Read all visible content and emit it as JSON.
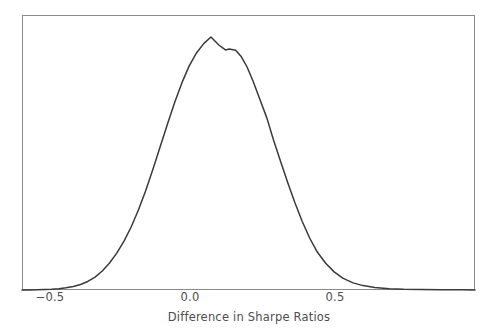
{
  "figure": {
    "background_color": "#ffffff",
    "axes_background_color": "#ffffff"
  },
  "axes": {
    "spine_color": "#8a8a8a",
    "spine_width": 1,
    "left_px": 22,
    "right_px": 475,
    "top_px": 15,
    "bottom_px": 290
  },
  "chart_data": {
    "type": "line",
    "title": "",
    "subtitle": "",
    "xlabel": "Difference in Sharpe Ratios",
    "ylabel": "",
    "grid": false,
    "legend": null,
    "legend_position": "none",
    "line_color": "#3a3a3a",
    "line_width": 1.5,
    "xticks": [
      -0.5,
      0.0,
      0.5
    ],
    "xtick_labels": [
      "−0.5",
      "0.0",
      "0.5"
    ],
    "yticks": [],
    "ytick_labels": [],
    "xlim": [
      -0.597,
      0.966
    ],
    "ylim": [
      0,
      1.0
    ],
    "series": [
      {
        "name": "Difference in Sharpe Ratios density",
        "x": [
          -0.597,
          -0.57,
          -0.545,
          -0.52,
          -0.495,
          -0.47,
          -0.445,
          -0.42,
          -0.395,
          -0.37,
          -0.345,
          -0.32,
          -0.295,
          -0.27,
          -0.245,
          -0.22,
          -0.195,
          -0.17,
          -0.145,
          -0.12,
          -0.095,
          -0.07,
          -0.045,
          -0.02,
          0.005,
          0.03,
          0.055,
          0.083,
          0.105,
          0.118,
          0.14,
          0.16,
          0.18,
          0.2,
          0.222,
          0.248,
          0.27,
          0.295,
          0.32,
          0.345,
          0.37,
          0.395,
          0.42,
          0.45,
          0.48,
          0.51,
          0.545,
          0.58,
          0.62,
          0.67,
          0.72,
          0.78,
          0.85,
          0.92,
          0.966
        ],
        "y": [
          0.0,
          0.0,
          0.001,
          0.002,
          0.003,
          0.005,
          0.008,
          0.013,
          0.02,
          0.031,
          0.047,
          0.069,
          0.098,
          0.134,
          0.178,
          0.23,
          0.292,
          0.362,
          0.44,
          0.522,
          0.604,
          0.683,
          0.754,
          0.815,
          0.862,
          0.896,
          0.92,
          0.89,
          0.873,
          0.876,
          0.872,
          0.848,
          0.81,
          0.76,
          0.698,
          0.625,
          0.548,
          0.468,
          0.39,
          0.316,
          0.249,
          0.19,
          0.141,
          0.098,
          0.066,
          0.043,
          0.026,
          0.016,
          0.009,
          0.005,
          0.003,
          0.002,
          0.001,
          0.001,
          0.0
        ]
      }
    ]
  },
  "xtick_positions_px": [
    50,
    190,
    335
  ],
  "annotations": []
}
